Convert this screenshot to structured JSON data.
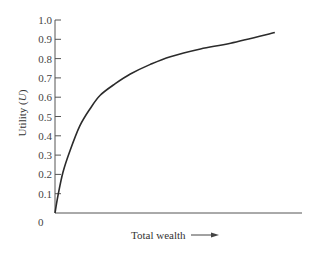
{
  "chart_data": {
    "type": "line",
    "title": "",
    "xlabel": "Total wealth",
    "ylabel": "Utility (U)",
    "ylabel_parts": {
      "prefix": "Utility (",
      "italic": "U",
      "suffix": ")"
    },
    "yticks": [
      "0",
      "0.1",
      "0.2",
      "0.3",
      "0.4",
      "0.5",
      "0.6",
      "0.7",
      "0.8",
      "0.9",
      "1.0"
    ],
    "ylim": [
      0,
      1.0
    ],
    "xlim": [
      0,
      1.0
    ],
    "x_ticks_labeled": false,
    "grid": false,
    "legend": null,
    "series": [
      {
        "name": "Utility curve",
        "x": [
          0.0,
          0.012,
          0.032,
          0.06,
          0.1,
          0.142,
          0.183,
          0.244,
          0.305,
          0.386,
          0.467,
          0.589,
          0.711,
          0.89
        ],
        "y": [
          0.0,
          0.09,
          0.21,
          0.32,
          0.45,
          0.54,
          0.61,
          0.67,
          0.72,
          0.77,
          0.81,
          0.85,
          0.88,
          0.935
        ]
      }
    ],
    "annotations": [
      "arrow after x-axis label indicating increasing wealth"
    ]
  },
  "axis": {
    "origin_label": "0",
    "x_label": "Total wealth",
    "y_label_prefix": "Utility (",
    "y_label_italic": "U",
    "y_label_suffix": ")"
  },
  "colors": {
    "line": "#2b2b2b",
    "axis": "#555555",
    "text": "#444444"
  }
}
